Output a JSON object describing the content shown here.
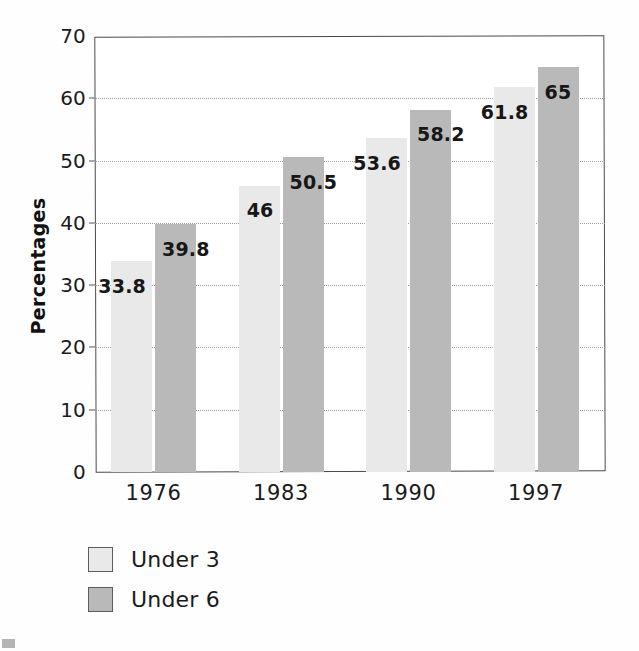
{
  "chart_data": {
    "type": "bar",
    "title": "",
    "subtitle": "",
    "xlabel": "",
    "ylabel": "Percentages",
    "categories": [
      "1976",
      "1983",
      "1990",
      "1997"
    ],
    "series": [
      {
        "name": "Under 3",
        "color": "#e9e9e9",
        "values": [
          33.8,
          46,
          53.6,
          61.8
        ],
        "labels": [
          "33.8",
          "46",
          "53.6",
          "61.8"
        ]
      },
      {
        "name": "Under 6",
        "color": "#b9b9b9",
        "values": [
          39.8,
          50.5,
          58.2,
          65
        ],
        "labels": [
          "39.8",
          "50.5",
          "58.2",
          "65"
        ]
      }
    ],
    "ylim": [
      0,
      70
    ],
    "yticks": [
      0,
      10,
      20,
      30,
      40,
      50,
      60,
      70
    ],
    "ytick_labels": [
      "0",
      "10",
      "20",
      "30",
      "40",
      "50",
      "60",
      "70"
    ],
    "grid": true,
    "grid_axis": "y",
    "grid_style": "dotted",
    "legend_position": "below-left",
    "frame": true,
    "bar_orientation": "vertical",
    "value_labels_shown": true
  },
  "axes": {
    "y_title": "Percentages",
    "y_ticks": [
      "0",
      "10",
      "20",
      "30",
      "40",
      "50",
      "60",
      "70"
    ],
    "x_ticks": [
      "1976",
      "1983",
      "1990",
      "1997"
    ]
  },
  "legend": {
    "items": [
      {
        "label": "Under 3",
        "color": "#e9e9e9"
      },
      {
        "label": "Under 6",
        "color": "#b9b9b9"
      }
    ]
  },
  "colors": {
    "series_under_3": "#e9e9e9",
    "series_under_6": "#b9b9b9",
    "frame": "#4a4a4a",
    "gridline": "#9a9a9a",
    "text": "#1b1b1b",
    "background": "#ffffff"
  }
}
